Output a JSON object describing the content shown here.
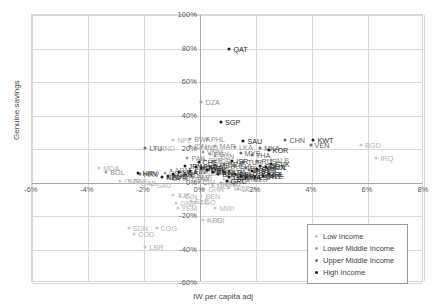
{
  "chart_data": {
    "type": "scatter",
    "title": "",
    "xlabel": "IW per capita adj",
    "ylabel": "Genuine savings",
    "xlim": [
      -6,
      8
    ],
    "ylim": [
      -60,
      100
    ],
    "grid": true,
    "legend_position": "bottom-right",
    "xticks": [
      "-6%",
      "-4%",
      "-2%",
      "0%",
      "2%",
      "4%",
      "6%",
      "8%"
    ],
    "xtick_values": [
      -6,
      -4,
      -2,
      0,
      2,
      4,
      6,
      8
    ],
    "yticks": [
      "100%",
      "80%",
      "60%",
      "40%",
      "20%",
      "0%",
      "-20%",
      "-40%",
      "-60%"
    ],
    "ytick_values": [
      100,
      80,
      60,
      40,
      20,
      0,
      -20,
      -40,
      -60
    ],
    "legend": [
      {
        "name": "Low Income",
        "color": "#c9c9c9"
      },
      {
        "name": "Lower Middle Income",
        "color": "#a0a0a0"
      },
      {
        "name": "Upper Middle Income",
        "color": "#6e6e6e"
      },
      {
        "name": "High Income",
        "color": "#1d1d1d"
      }
    ],
    "series": [
      {
        "name": "Low Income",
        "color": "#c9c9c9",
        "points": [
          {
            "label": "SDN",
            "x": -2.55,
            "y": -27.0
          },
          {
            "label": "COG",
            "x": -1.55,
            "y": -27.0
          },
          {
            "label": "COD",
            "x": -2.35,
            "y": -31.0
          },
          {
            "label": "LBR",
            "x": -1.95,
            "y": -38.5
          },
          {
            "label": "AFG",
            "x": 0.12,
            "y": -22.5
          },
          {
            "label": "BDI",
            "x": 0.3,
            "y": -22.5
          },
          {
            "label": "YEM",
            "x": -0.8,
            "y": -15.5
          },
          {
            "label": "SLE",
            "x": -0.32,
            "y": -11.0
          },
          {
            "label": "TGO",
            "x": -0.15,
            "y": -11.5
          },
          {
            "label": "MWI",
            "x": 0.55,
            "y": -15.5
          },
          {
            "label": "GIN",
            "x": -0.7,
            "y": -8.0
          },
          {
            "label": "GNB",
            "x": -0.85,
            "y": -12.0
          },
          {
            "label": "TJK",
            "x": -0.95,
            "y": -7.5
          },
          {
            "label": "BEN",
            "x": 0.05,
            "y": -8.0
          },
          {
            "label": "GHA",
            "x": 0.15,
            "y": -4.0
          },
          {
            "label": "NPL",
            "x": -0.95,
            "y": 25.5
          },
          {
            "label": "HND",
            "x": -1.6,
            "y": 20.5
          },
          {
            "label": "MDA",
            "x": -3.6,
            "y": 8.5
          },
          {
            "label": "CMR",
            "x": -2.85,
            "y": 1.0
          },
          {
            "label": "ZWE",
            "x": -2.55,
            "y": 1.0
          },
          {
            "label": "GAB",
            "x": -2.25,
            "y": 0.0
          },
          {
            "label": "SAU",
            "x": -1.7,
            "y": -1.5
          },
          {
            "label": "UGA",
            "x": 1.35,
            "y": -4.0
          },
          {
            "label": "MOZ",
            "x": 1.05,
            "y": -3.5
          },
          {
            "label": "BGD",
            "x": 5.75,
            "y": 22.5
          },
          {
            "label": "IRQ",
            "x": 6.3,
            "y": 14.5
          },
          {
            "label": "MLI",
            "x": 0.45,
            "y": -2.0
          },
          {
            "label": "NER",
            "x": 0.65,
            "y": -1.0
          },
          {
            "label": "RWA",
            "x": 0.85,
            "y": 2.0
          },
          {
            "label": "ETH",
            "x": 0.95,
            "y": 4.0
          },
          {
            "label": "TZA",
            "x": 1.15,
            "y": 1.5
          },
          {
            "label": "KEN",
            "x": 0.25,
            "y": 6.0
          },
          {
            "label": "ZMB",
            "x": -0.25,
            "y": 3.0
          },
          {
            "label": "SEN",
            "x": 0.05,
            "y": 5.5
          },
          {
            "label": "BFA",
            "x": 0.35,
            "y": 7.5
          },
          {
            "label": "MDG",
            "x": -0.45,
            "y": 2.0
          },
          {
            "label": "HTI",
            "x": -0.6,
            "y": 5.0
          },
          {
            "label": "NIC",
            "x": -0.15,
            "y": 9.0
          }
        ]
      },
      {
        "name": "Lower Middle Income",
        "color": "#a0a0a0",
        "points": [
          {
            "label": "DZA",
            "x": 0.05,
            "y": 48.0
          },
          {
            "label": "PHL",
            "x": 0.25,
            "y": 26.0
          },
          {
            "label": "BWA",
            "x": -0.35,
            "y": 26.0
          },
          {
            "label": "IDN",
            "x": -0.35,
            "y": 21.5
          },
          {
            "label": "IND",
            "x": 0.05,
            "y": 21.0
          },
          {
            "label": "MAR",
            "x": 0.55,
            "y": 21.5
          },
          {
            "label": "LKA",
            "x": 1.25,
            "y": 21.0
          },
          {
            "label": "VNM",
            "x": 0.1,
            "y": 18.5
          },
          {
            "label": "EGY",
            "x": 0.35,
            "y": 17.0
          },
          {
            "label": "TUN",
            "x": 0.55,
            "y": 16.0
          },
          {
            "label": "PAK",
            "x": -0.45,
            "y": 14.5
          },
          {
            "label": "SYR",
            "x": 0.15,
            "y": 13.5
          },
          {
            "label": "JOR",
            "x": 0.45,
            "y": 13.0
          },
          {
            "label": "BOL",
            "x": -3.35,
            "y": 6.0
          },
          {
            "label": "PRY",
            "x": -0.95,
            "y": 3.5
          },
          {
            "label": "ECU",
            "x": -0.55,
            "y": 4.5
          },
          {
            "label": "SLV",
            "x": -0.25,
            "y": 3.0
          },
          {
            "label": "GTM",
            "x": -1.15,
            "y": 2.5
          },
          {
            "label": "CIV",
            "x": -0.05,
            "y": 0.5
          },
          {
            "label": "COL",
            "x": 0.65,
            "y": 7.0
          },
          {
            "label": "PER",
            "x": 0.95,
            "y": 8.5
          },
          {
            "label": "MNG",
            "x": 1.45,
            "y": 2.0
          },
          {
            "label": "UZB",
            "x": 1.75,
            "y": 2.0
          },
          {
            "label": "ARM",
            "x": -1.05,
            "y": 7.5
          },
          {
            "label": "GEO",
            "x": -1.25,
            "y": 5.5
          },
          {
            "label": "ALB",
            "x": 2.55,
            "y": 13.5
          },
          {
            "label": "PNG",
            "x": 0.75,
            "y": 0.0
          }
        ]
      },
      {
        "name": "Upper Middle Income",
        "color": "#6e6e6e",
        "points": [
          {
            "label": "CHN",
            "x": 3.05,
            "y": 25.5
          },
          {
            "label": "THA",
            "x": 1.85,
            "y": 16.5
          },
          {
            "label": "MYS",
            "x": 1.45,
            "y": 17.5
          },
          {
            "label": "MKA",
            "x": 2.15,
            "y": 20.5
          },
          {
            "label": "RUS",
            "x": 2.05,
            "y": 13.0
          },
          {
            "label": "TUR",
            "x": 1.55,
            "y": 12.0
          },
          {
            "label": "BRA",
            "x": 0.85,
            "y": 11.0
          },
          {
            "label": "MEX",
            "x": 0.55,
            "y": 10.5
          },
          {
            "label": "ZAF",
            "x": 0.35,
            "y": 9.0
          },
          {
            "label": "CHL",
            "x": 1.25,
            "y": 10.0
          },
          {
            "label": "ARG",
            "x": 0.15,
            "y": 9.5
          },
          {
            "label": "ROU",
            "x": 1.75,
            "y": 7.5
          },
          {
            "label": "BGR",
            "x": 1.95,
            "y": 6.0
          },
          {
            "label": "KAZ",
            "x": 2.25,
            "y": 5.0
          },
          {
            "label": "UKR",
            "x": 1.15,
            "y": 4.5
          },
          {
            "label": "SRB",
            "x": 1.35,
            "y": 3.0
          },
          {
            "label": "HRV",
            "x": -2.15,
            "y": 5.0
          },
          {
            "label": "LTU",
            "x": -1.95,
            "y": 20.5
          },
          {
            "label": "LVA",
            "x": 1.05,
            "y": 6.5
          },
          {
            "label": "BLR",
            "x": 1.65,
            "y": 8.5
          },
          {
            "label": "AZE",
            "x": 2.35,
            "y": 4.0
          },
          {
            "label": "VEN",
            "x": 3.95,
            "y": 22.5
          },
          {
            "label": "POL",
            "x": 2.45,
            "y": 9.5
          }
        ]
      },
      {
        "name": "High Income",
        "color": "#1d1d1d",
        "points": [
          {
            "label": "QAT",
            "x": 1.05,
            "y": 80.0
          },
          {
            "label": "SGP",
            "x": 0.75,
            "y": 36.0
          },
          {
            "label": "KWT",
            "x": 4.05,
            "y": 25.5
          },
          {
            "label": "KOR",
            "x": 2.45,
            "y": 19.5
          },
          {
            "label": "SAU",
            "x": 1.55,
            "y": 25.0
          },
          {
            "label": "HRV",
            "x": -2.2,
            "y": 5.5
          },
          {
            "label": "SVK",
            "x": 2.55,
            "y": 11.0
          },
          {
            "label": "HUN",
            "x": 2.35,
            "y": 9.0
          },
          {
            "label": "CZE",
            "x": 2.15,
            "y": 10.0
          },
          {
            "label": "SVN",
            "x": 2.05,
            "y": 8.0
          },
          {
            "label": "EST",
            "x": 1.85,
            "y": 7.0
          },
          {
            "label": "IRL",
            "x": 2.45,
            "y": 5.0
          },
          {
            "label": "PRT",
            "x": 2.25,
            "y": 4.0
          },
          {
            "label": "ESP",
            "x": 1.95,
            "y": 3.5
          },
          {
            "label": "ITA",
            "x": 1.65,
            "y": 3.0
          },
          {
            "label": "FRA",
            "x": 1.45,
            "y": 4.0
          },
          {
            "label": "DEU",
            "x": 1.25,
            "y": 5.0
          },
          {
            "label": "GBR",
            "x": 1.05,
            "y": 3.5
          },
          {
            "label": "NLD",
            "x": 0.85,
            "y": 6.0
          },
          {
            "label": "BEL",
            "x": 0.65,
            "y": 5.0
          },
          {
            "label": "AUT",
            "x": 0.45,
            "y": 6.5
          },
          {
            "label": "DNK",
            "x": 0.25,
            "y": 7.5
          },
          {
            "label": "SWE",
            "x": 0.05,
            "y": 8.5
          },
          {
            "label": "NOR",
            "x": -0.15,
            "y": 9.5
          },
          {
            "label": "FIN",
            "x": -0.35,
            "y": 7.0
          },
          {
            "label": "JPN",
            "x": -0.55,
            "y": 10.0
          },
          {
            "label": "USA",
            "x": -0.75,
            "y": 6.0
          },
          {
            "label": "CAN",
            "x": -0.95,
            "y": 5.0
          },
          {
            "label": "AUS",
            "x": -1.15,
            "y": 4.0
          },
          {
            "label": "NZL",
            "x": -1.35,
            "y": 3.0
          },
          {
            "label": "CHE",
            "x": -0.05,
            "y": 12.0
          },
          {
            "label": "GRC",
            "x": 0.95,
            "y": 1.0
          },
          {
            "label": "ISR",
            "x": 1.15,
            "y": 13.0
          }
        ]
      }
    ]
  }
}
